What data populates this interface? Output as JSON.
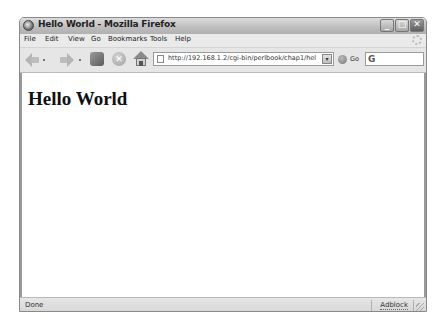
{
  "window": {
    "title": "Hello World - Mozilla Firefox",
    "controls": {
      "minimize": "_",
      "maximize": "□",
      "close": "✕"
    }
  },
  "menubar": {
    "items": [
      {
        "label": "File",
        "accel": "F"
      },
      {
        "label": "Edit",
        "accel": "E"
      },
      {
        "label": "View",
        "accel": "V"
      },
      {
        "label": "Go",
        "accel": "G"
      },
      {
        "label": "Bookmarks",
        "accel": "B"
      },
      {
        "label": "Tools",
        "accel": "T"
      },
      {
        "label": "Help",
        "accel": "H"
      }
    ]
  },
  "navbar": {
    "icons": [
      "back-icon",
      "forward-icon",
      "reload-icon",
      "stop-icon",
      "home-icon"
    ],
    "url": "http://192.168.1.2/cgi-bin/perlbook/chap1/hello",
    "go_label": "Go",
    "search_placeholder": "",
    "search_engine_glyph": "G"
  },
  "content": {
    "heading": "Hello World"
  },
  "statusbar": {
    "status": "Done",
    "adblock": "Adblock"
  }
}
